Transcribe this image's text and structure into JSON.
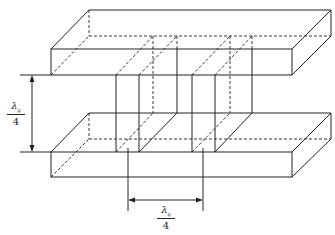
{
  "diagram": {
    "type": "waveguide-section-with-quarter-wave-posts",
    "labels": {
      "vertical_spacing": {
        "numerator": "λ",
        "subscript": "g",
        "denominator": "4"
      },
      "horizontal_spacing": {
        "numerator": "λ",
        "subscript": "g",
        "denominator": "4"
      }
    },
    "colors": {
      "line": "#222222",
      "background": "#ffffff"
    }
  }
}
